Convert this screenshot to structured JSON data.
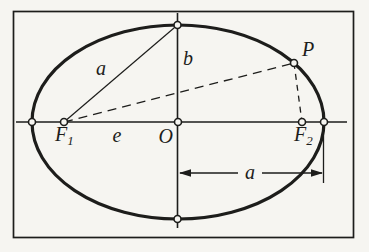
{
  "figure": {
    "type": "ellipse-geometry-diagram",
    "labels": {
      "slant_a": "a",
      "semi_minor_b": "b",
      "eccentricity_e": "e",
      "center_O": "O",
      "point_P": "P",
      "dimension_a": "a",
      "focus1": {
        "base": "F",
        "sub": "1"
      },
      "focus2": {
        "base": "F",
        "sub": "2"
      }
    },
    "colors": {
      "ink": "#1d1d1b",
      "paper": "#f6f5f1"
    }
  }
}
